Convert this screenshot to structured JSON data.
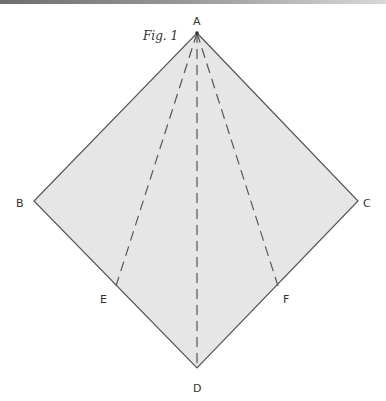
{
  "figure": {
    "caption": "Fig. 1",
    "fill_color": "#e6e6e6",
    "stroke_color": "#555555",
    "points": {
      "A": {
        "label": "A",
        "x": 197,
        "y": 33
      },
      "B": {
        "label": "B",
        "x": 34,
        "y": 201
      },
      "C": {
        "label": "C",
        "x": 358,
        "y": 201
      },
      "D": {
        "label": "D",
        "x": 197,
        "y": 368
      },
      "E": {
        "label": "E",
        "x": 116,
        "y": 286
      },
      "F": {
        "label": "F",
        "x": 278,
        "y": 286
      }
    },
    "solid_edges": [
      "AB",
      "BD",
      "DC",
      "CA"
    ],
    "dashed_lines": [
      "AE",
      "AD",
      "AF"
    ]
  }
}
